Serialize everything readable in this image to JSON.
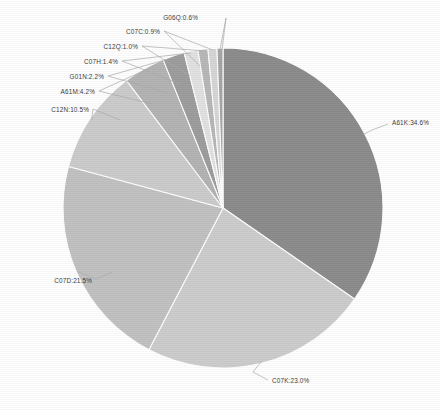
{
  "chart_data": {
    "type": "pie",
    "title": "",
    "categories": [
      "A61K",
      "C07K",
      "C07D",
      "C12N",
      "A61M",
      "G01N",
      "C07H",
      "C12Q",
      "C07C",
      "G06Q"
    ],
    "values": [
      34.6,
      23.0,
      21.5,
      10.5,
      4.2,
      2.2,
      1.4,
      1.0,
      0.9,
      0.6
    ],
    "value_unit": "%",
    "labels": [
      "A61K:34.6%",
      "C07K:23.0%",
      "C07D:21.5%",
      "C12N:10.5%",
      "A61M:4.2%",
      "G01N:2.2%",
      "C07H:1.4%",
      "C12Q:1.0%",
      "C07C:0.9%",
      "G06Q:0.6%"
    ],
    "colors": [
      "#8d8d8d",
      "#cdcdcd",
      "#c2c2c2",
      "#cccccc",
      "#b4b4b4",
      "#9e9e9e",
      "#e2e2e2",
      "#b8b8b8",
      "#d6d6d6",
      "#a6a6a6"
    ],
    "legend": "none",
    "grid": false,
    "start_angle_deg": -90,
    "direction": "clockwise",
    "background": "#ffffff",
    "label_color": "#3c3c3c",
    "leader_color": "#aaaaaa",
    "center": {
      "x": 223,
      "y": 208
    },
    "radius": 160
  },
  "label_positions": [
    {
      "x": 392,
      "y": 125,
      "align": "right",
      "lx1": 372,
      "ly1": 130,
      "lx2": 388,
      "ly2": 124
    },
    {
      "x": 272,
      "y": 383,
      "align": "right",
      "lx1": 253,
      "ly1": 372,
      "lx2": 268,
      "ly2": 380
    },
    {
      "x": 92,
      "y": 283,
      "align": "left",
      "lx1": 96,
      "ly1": 279,
      "lx2": 112,
      "ly2": 272
    },
    {
      "x": 89,
      "y": 112,
      "align": "left",
      "lx1": 93,
      "ly1": 109,
      "lx2": 120,
      "ly2": 120
    },
    {
      "x": 95,
      "y": 94,
      "align": "left",
      "lx1": 99,
      "ly1": 91,
      "lx2": 152,
      "ly2": 104
    },
    {
      "x": 104,
      "y": 79,
      "align": "left",
      "lx1": 108,
      "ly1": 76,
      "lx2": 168,
      "ly2": 93
    },
    {
      "x": 118,
      "y": 64,
      "align": "left",
      "lx1": 122,
      "ly1": 61,
      "lx2": 180,
      "ly2": 84
    },
    {
      "x": 138,
      "y": 49,
      "align": "left",
      "lx1": 142,
      "ly1": 46,
      "lx2": 190,
      "ly2": 76
    },
    {
      "x": 160,
      "y": 34,
      "align": "left",
      "lx1": 164,
      "ly1": 31,
      "lx2": 200,
      "ly2": 66
    },
    {
      "x": 198,
      "y": 20,
      "align": "left",
      "lx1": 226,
      "ly1": 18,
      "lx2": 222,
      "ly2": 50
    }
  ]
}
